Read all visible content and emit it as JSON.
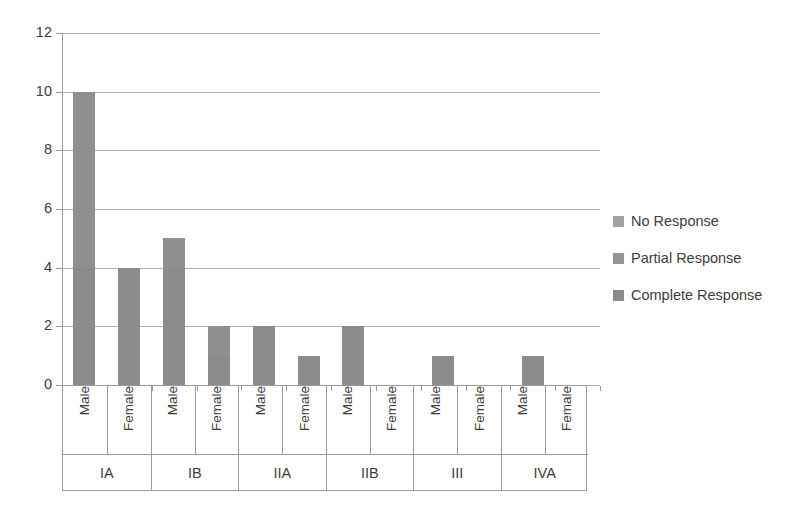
{
  "chart_data": {
    "type": "bar",
    "stacked": true,
    "title": "",
    "xlabel": "",
    "ylabel": "",
    "ylim": [
      0,
      12
    ],
    "yticks": [
      0,
      2,
      4,
      6,
      8,
      10,
      12
    ],
    "grid": true,
    "legend_position": "right",
    "categories": [
      "IA Male",
      "IA Female",
      "IB Male",
      "IB Female",
      "IIA Male",
      "IIA Female",
      "IIB Male",
      "IIB Female",
      "III Male",
      "III Female",
      "IVA Male",
      "IVA Female"
    ],
    "groups": [
      {
        "label": "IA",
        "sexes": [
          "Male",
          "Female"
        ]
      },
      {
        "label": "IB",
        "sexes": [
          "Male",
          "Female"
        ]
      },
      {
        "label": "IIA",
        "sexes": [
          "Male",
          "Female"
        ]
      },
      {
        "label": "IIB",
        "sexes": [
          "Male",
          "Female"
        ]
      },
      {
        "label": "III",
        "sexes": [
          "Male",
          "Female"
        ]
      },
      {
        "label": "IVA",
        "sexes": [
          "Male",
          "Female"
        ]
      }
    ],
    "series": [
      {
        "name": "Complete Response",
        "color": "#8c8c8c",
        "values": [
          4,
          4,
          4,
          1,
          2,
          1,
          2,
          0,
          1,
          0,
          1,
          0
        ]
      },
      {
        "name": "Partial Response",
        "color": "#8f8f8f",
        "values": [
          6,
          0,
          1,
          1,
          0,
          0,
          0,
          0,
          0,
          0,
          0,
          0
        ]
      },
      {
        "name": "No Response",
        "color": "#a3a3a3",
        "values": [
          0,
          0,
          0,
          0,
          0,
          0,
          0,
          0,
          0,
          0,
          0,
          0
        ]
      }
    ],
    "totals": [
      10,
      4,
      5,
      2,
      2,
      1,
      2,
      0,
      1,
      0,
      1,
      0
    ],
    "ytick_labels": [
      "0",
      "2",
      "4",
      "6",
      "8",
      "10",
      "12"
    ]
  },
  "legend": {
    "items": [
      {
        "label": "No Response",
        "color": "#a3a3a3"
      },
      {
        "label": "Partial Response",
        "color": "#949494"
      },
      {
        "label": "Complete Response",
        "color": "#8a8a8a"
      }
    ]
  },
  "colors": {
    "axis": "#9a9a9a",
    "grid": "#b0b0b0",
    "text": "#3d3d3d",
    "background": "#ffffff"
  }
}
